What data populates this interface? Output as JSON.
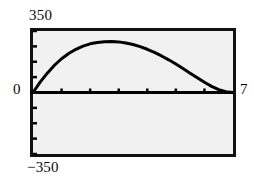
{
  "figure": {
    "name": "calculator-graph",
    "background_color": "#ffffff",
    "plot_background_color": "#f1f1f1",
    "frame_color": "#111111",
    "curve_color": "#000000"
  },
  "labels": {
    "y_max": "350",
    "y_min": "−350",
    "origin": "0",
    "x_max": "7"
  },
  "chart_data": {
    "type": "line",
    "title": "",
    "subtitle": "",
    "xlabel": "",
    "ylabel": "",
    "xlim": [
      0,
      7
    ],
    "ylim": [
      -350,
      350
    ],
    "grid": false,
    "legend": null,
    "axis_tick_labels": {
      "x": [
        "0",
        "7"
      ],
      "y": [
        "−350",
        "0",
        "350"
      ]
    },
    "x_tick_values": [
      1,
      2,
      3,
      4,
      5,
      6
    ],
    "y_tick_values": [
      -350,
      -262.5,
      -175,
      -87.5,
      87.5,
      175,
      262.5,
      350
    ],
    "series": [
      {
        "name": "curve",
        "x": [
          0.0,
          0.25,
          0.5,
          0.75,
          1.0,
          1.25,
          1.5,
          1.75,
          2.0,
          2.25,
          2.5,
          2.75,
          3.0,
          3.25,
          3.5,
          3.75,
          4.0,
          4.25,
          4.5,
          4.75,
          5.0,
          5.25,
          5.5,
          5.75,
          6.0,
          6.25,
          6.5,
          6.75,
          7.0
        ],
        "y": [
          0,
          59,
          110,
          155,
          192,
          222,
          246,
          264,
          277,
          285,
          289,
          290,
          288,
          282,
          273,
          261,
          246,
          228,
          208,
          186,
          162,
          136,
          110,
          84,
          58,
          35,
          16,
          4,
          0
        ]
      }
    ],
    "annotations": []
  }
}
